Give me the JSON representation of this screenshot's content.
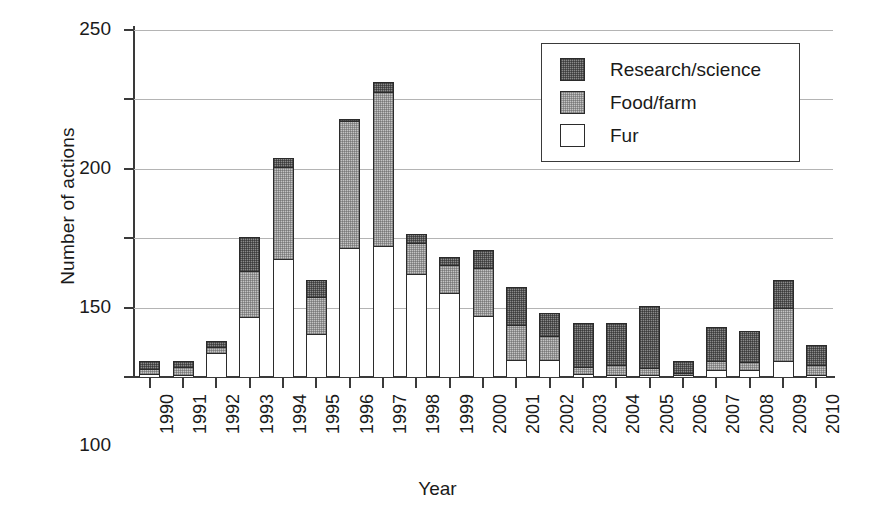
{
  "chart_data": {
    "type": "bar",
    "subtype": "stacked-vertical",
    "title": "",
    "xlabel": "Year",
    "ylabel": "Number of actions",
    "ylim": [
      0,
      250
    ],
    "yticks": [
      0,
      50,
      100,
      150,
      200,
      250
    ],
    "grid": true,
    "legend_position": "top-right",
    "categories": [
      "1990",
      "1991",
      "1992",
      "1993",
      "1994",
      "1995",
      "1996",
      "1997",
      "1998",
      "1999",
      "2000",
      "2001",
      "2002",
      "2003",
      "2004",
      "2005",
      "2006",
      "2007",
      "2008",
      "2009",
      "2010"
    ],
    "series": [
      {
        "name": "Fur",
        "color": "#ffffff",
        "values": [
          3,
          2,
          18,
          44,
          86,
          32,
          94,
          95,
          75,
          61,
          45,
          13,
          13,
          3,
          2,
          2,
          2,
          6,
          6,
          12,
          2
        ]
      },
      {
        "name": "Food/farm",
        "color": "#c4c4c4",
        "values": [
          4,
          7,
          5,
          34,
          67,
          27,
          92,
          112,
          23,
          21,
          35,
          26,
          18,
          6,
          8,
          6,
          2,
          7,
          6,
          39,
          8
        ]
      },
      {
        "name": "Research/science",
        "color": "#8a8a8a",
        "values": [
          7,
          5,
          5,
          25,
          7,
          13,
          2,
          8,
          7,
          7,
          14,
          28,
          17,
          32,
          31,
          45,
          10,
          25,
          23,
          21,
          15
        ]
      }
    ],
    "totals": [
      14,
      14,
      28,
      103,
      160,
      72,
      188,
      215,
      105,
      89,
      94,
      67,
      48,
      41,
      41,
      53,
      14,
      38,
      35,
      72,
      25
    ]
  },
  "legend": {
    "items": [
      {
        "label": "Research/science",
        "swatch": "research-swatch"
      },
      {
        "label": "Food/farm",
        "swatch": "food-swatch"
      },
      {
        "label": "Fur",
        "swatch": "fur-swatch"
      }
    ]
  }
}
